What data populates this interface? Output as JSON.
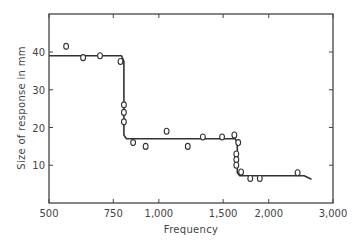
{
  "chart_data": {
    "type": "scatter",
    "title": "",
    "xlabel": "Frequency",
    "ylabel": "Size of response in mm",
    "xscale": "log",
    "xlim": [
      500,
      3000
    ],
    "ylim": [
      0,
      50
    ],
    "x_ticks": [
      500,
      750,
      1000,
      1500,
      2000,
      3000
    ],
    "x_tick_labels": [
      "500",
      "750",
      "1,000",
      "1,500",
      "2,000",
      "3,000"
    ],
    "y_ticks": [
      10,
      20,
      30,
      40
    ],
    "y_tick_labels": [
      "10",
      "20",
      "30",
      "40"
    ],
    "grid": false,
    "legend": null,
    "series": [
      {
        "name": "observations",
        "marker": "open-circle",
        "points": [
          {
            "x": 557,
            "y": 41.5
          },
          {
            "x": 620,
            "y": 38.5
          },
          {
            "x": 690,
            "y": 39
          },
          {
            "x": 785,
            "y": 37.5
          },
          {
            "x": 802,
            "y": 26
          },
          {
            "x": 802,
            "y": 24
          },
          {
            "x": 802,
            "y": 21.5
          },
          {
            "x": 850,
            "y": 16
          },
          {
            "x": 920,
            "y": 15
          },
          {
            "x": 1050,
            "y": 19
          },
          {
            "x": 1200,
            "y": 15
          },
          {
            "x": 1320,
            "y": 17.5
          },
          {
            "x": 1490,
            "y": 17.5
          },
          {
            "x": 1610,
            "y": 18
          },
          {
            "x": 1650,
            "y": 16
          },
          {
            "x": 1630,
            "y": 13
          },
          {
            "x": 1630,
            "y": 11.5
          },
          {
            "x": 1630,
            "y": 10
          },
          {
            "x": 1680,
            "y": 8.2
          },
          {
            "x": 1780,
            "y": 6.5
          },
          {
            "x": 1890,
            "y": 6.5
          },
          {
            "x": 2400,
            "y": 8
          }
        ]
      },
      {
        "name": "fitted step curve",
        "marker": "line",
        "points": [
          {
            "x": 500,
            "y": 39
          },
          {
            "x": 790,
            "y": 39
          },
          {
            "x": 802,
            "y": 37.5
          },
          {
            "x": 802,
            "y": 18
          },
          {
            "x": 815,
            "y": 17
          },
          {
            "x": 1620,
            "y": 17
          },
          {
            "x": 1640,
            "y": 16
          },
          {
            "x": 1640,
            "y": 8
          },
          {
            "x": 1665,
            "y": 7.2
          },
          {
            "x": 2500,
            "y": 7.2
          },
          {
            "x": 2620,
            "y": 6.3
          }
        ]
      }
    ]
  }
}
